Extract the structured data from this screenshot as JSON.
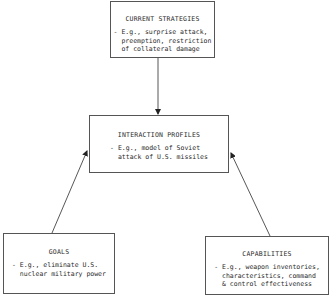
{
  "diagram": {
    "nodes": [
      {
        "id": "current-strategies",
        "title": "CURRENT STRATEGIES",
        "description": "- E.g., surprise attack,\n  preemption, restriction\n  of collateral damage"
      },
      {
        "id": "interaction-profiles",
        "title": "INTERACTION PROFILES",
        "description": "- E.g., model of Soviet\n  attack of U.S. missiles"
      },
      {
        "id": "goals",
        "title": "GOALS",
        "description": "- E.g., eliminate U.S.\n  nuclear military power"
      },
      {
        "id": "capabilities",
        "title": "CAPABILITIES",
        "description": "- E.g., weapon inventories,\n  characteristics, command\n  & control effectiveness"
      }
    ],
    "edges": [
      {
        "from": "current-strategies",
        "to": "interaction-profiles"
      },
      {
        "from": "goals",
        "to": "interaction-profiles"
      },
      {
        "from": "capabilities",
        "to": "interaction-profiles"
      }
    ],
    "colors": {
      "line": "#444444",
      "border": "#555555",
      "text": "#2a2a2a",
      "background": "#ffffff"
    }
  }
}
